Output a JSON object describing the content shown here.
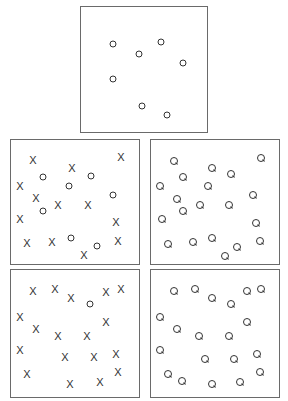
{
  "figure": {
    "colors": {
      "stroke": "#333333",
      "border": "#6a6a6a",
      "background": "#ffffff"
    }
  },
  "panels": [
    {
      "id": "top",
      "box": [
        80,
        6,
        128,
        127
      ],
      "items": [
        {
          "type": "O",
          "x": 113,
          "y": 44
        },
        {
          "type": "O",
          "x": 139,
          "y": 54
        },
        {
          "type": "O",
          "x": 161,
          "y": 42
        },
        {
          "type": "O",
          "x": 183,
          "y": 63
        },
        {
          "type": "O",
          "x": 113,
          "y": 79
        },
        {
          "type": "O",
          "x": 142,
          "y": 106
        },
        {
          "type": "O",
          "x": 167,
          "y": 115
        }
      ]
    },
    {
      "id": "middle-left",
      "box": [
        10,
        139,
        130,
        126
      ],
      "items": [
        {
          "type": "X",
          "x": 33,
          "y": 160
        },
        {
          "type": "X",
          "x": 72,
          "y": 168
        },
        {
          "type": "X",
          "x": 121,
          "y": 157
        },
        {
          "type": "X",
          "x": 20,
          "y": 186
        },
        {
          "type": "X",
          "x": 36,
          "y": 198
        },
        {
          "type": "X",
          "x": 58,
          "y": 205
        },
        {
          "type": "X",
          "x": 88,
          "y": 205
        },
        {
          "type": "X",
          "x": 20,
          "y": 219
        },
        {
          "type": "X",
          "x": 116,
          "y": 222
        },
        {
          "type": "X",
          "x": 27,
          "y": 243
        },
        {
          "type": "X",
          "x": 52,
          "y": 242
        },
        {
          "type": "X",
          "x": 118,
          "y": 241
        },
        {
          "type": "X",
          "x": 84,
          "y": 255
        },
        {
          "type": "O",
          "x": 43,
          "y": 177
        },
        {
          "type": "O",
          "x": 91,
          "y": 176
        },
        {
          "type": "O",
          "x": 69,
          "y": 186
        },
        {
          "type": "O",
          "x": 113,
          "y": 195
        },
        {
          "type": "O",
          "x": 43,
          "y": 211
        },
        {
          "type": "O",
          "x": 71,
          "y": 238
        },
        {
          "type": "O",
          "x": 97,
          "y": 246
        }
      ]
    },
    {
      "id": "middle-right",
      "box": [
        150,
        139,
        130,
        126
      ],
      "items": [
        {
          "type": "Q",
          "x": 174,
          "y": 161
        },
        {
          "type": "Q",
          "x": 212,
          "y": 168
        },
        {
          "type": "Q",
          "x": 231,
          "y": 174
        },
        {
          "type": "Q",
          "x": 261,
          "y": 158
        },
        {
          "type": "Q",
          "x": 160,
          "y": 186
        },
        {
          "type": "Q",
          "x": 183,
          "y": 177
        },
        {
          "type": "Q",
          "x": 208,
          "y": 186
        },
        {
          "type": "Q",
          "x": 177,
          "y": 199
        },
        {
          "type": "Q",
          "x": 253,
          "y": 195
        },
        {
          "type": "Q",
          "x": 183,
          "y": 211
        },
        {
          "type": "Q",
          "x": 200,
          "y": 205
        },
        {
          "type": "Q",
          "x": 229,
          "y": 205
        },
        {
          "type": "Q",
          "x": 162,
          "y": 219
        },
        {
          "type": "Q",
          "x": 256,
          "y": 223
        },
        {
          "type": "Q",
          "x": 168,
          "y": 244
        },
        {
          "type": "Q",
          "x": 193,
          "y": 242
        },
        {
          "type": "Q",
          "x": 212,
          "y": 238
        },
        {
          "type": "Q",
          "x": 237,
          "y": 247
        },
        {
          "type": "Q",
          "x": 260,
          "y": 241
        },
        {
          "type": "Q",
          "x": 225,
          "y": 256
        }
      ]
    },
    {
      "id": "bottom-left",
      "box": [
        10,
        269,
        130,
        129
      ],
      "items": [
        {
          "type": "X",
          "x": 33,
          "y": 291
        },
        {
          "type": "X",
          "x": 55,
          "y": 289
        },
        {
          "type": "X",
          "x": 71,
          "y": 298
        },
        {
          "type": "X",
          "x": 106,
          "y": 292
        },
        {
          "type": "X",
          "x": 121,
          "y": 289
        },
        {
          "type": "X",
          "x": 20,
          "y": 317
        },
        {
          "type": "X",
          "x": 36,
          "y": 329
        },
        {
          "type": "X",
          "x": 58,
          "y": 336
        },
        {
          "type": "X",
          "x": 87,
          "y": 336
        },
        {
          "type": "X",
          "x": 106,
          "y": 322
        },
        {
          "type": "X",
          "x": 20,
          "y": 350
        },
        {
          "type": "X",
          "x": 65,
          "y": 357
        },
        {
          "type": "X",
          "x": 94,
          "y": 357
        },
        {
          "type": "X",
          "x": 116,
          "y": 354
        },
        {
          "type": "X",
          "x": 27,
          "y": 374
        },
        {
          "type": "X",
          "x": 70,
          "y": 384
        },
        {
          "type": "X",
          "x": 100,
          "y": 382
        },
        {
          "type": "X",
          "x": 118,
          "y": 372
        },
        {
          "type": "O",
          "x": 90,
          "y": 304
        }
      ]
    },
    {
      "id": "bottom-right",
      "box": [
        150,
        269,
        130,
        129
      ],
      "items": [
        {
          "type": "Q",
          "x": 174,
          "y": 291
        },
        {
          "type": "Q",
          "x": 195,
          "y": 289
        },
        {
          "type": "Q",
          "x": 212,
          "y": 298
        },
        {
          "type": "Q",
          "x": 231,
          "y": 304
        },
        {
          "type": "Q",
          "x": 247,
          "y": 291
        },
        {
          "type": "Q",
          "x": 261,
          "y": 289
        },
        {
          "type": "Q",
          "x": 160,
          "y": 317
        },
        {
          "type": "Q",
          "x": 177,
          "y": 329
        },
        {
          "type": "Q",
          "x": 199,
          "y": 336
        },
        {
          "type": "Q",
          "x": 229,
          "y": 336
        },
        {
          "type": "Q",
          "x": 247,
          "y": 322
        },
        {
          "type": "Q",
          "x": 160,
          "y": 350
        },
        {
          "type": "Q",
          "x": 205,
          "y": 359
        },
        {
          "type": "Q",
          "x": 234,
          "y": 359
        },
        {
          "type": "Q",
          "x": 257,
          "y": 354
        },
        {
          "type": "Q",
          "x": 168,
          "y": 374
        },
        {
          "type": "Q",
          "x": 182,
          "y": 381
        },
        {
          "type": "Q",
          "x": 212,
          "y": 384
        },
        {
          "type": "Q",
          "x": 240,
          "y": 382
        },
        {
          "type": "Q",
          "x": 260,
          "y": 372
        }
      ]
    }
  ],
  "glyph_labels": {
    "X": "X",
    "O": "O",
    "Q": "Q"
  }
}
